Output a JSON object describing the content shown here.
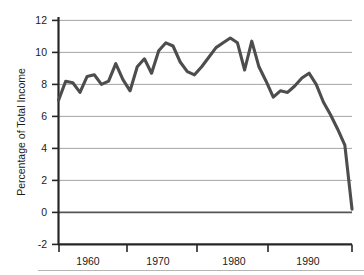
{
  "chart_data": {
    "type": "line",
    "title": "",
    "xlabel": "",
    "ylabel": "Percentage of Total Income",
    "xlim": [
      1955,
      1996
    ],
    "ylim": [
      -2,
      12
    ],
    "ytick_values": [
      12,
      10,
      8,
      6,
      4,
      2,
      0,
      -2
    ],
    "ytick_labels": [
      "12",
      "10",
      "8",
      "6",
      "4",
      "2",
      "0",
      "-2"
    ],
    "xtick_values": [
      1960,
      1970,
      1980,
      1990
    ],
    "xtick_labels": [
      "1960",
      "1970",
      "1980",
      "1990"
    ],
    "grid": "horizontal",
    "legend": "none",
    "line_color": "#4d4d4d",
    "axis_color": "#262626",
    "grid_color": "#9a9a9a",
    "x": [
      1955,
      1956,
      1957,
      1958,
      1959,
      1960,
      1961,
      1962,
      1963,
      1964,
      1965,
      1966,
      1967,
      1968,
      1969,
      1970,
      1971,
      1972,
      1973,
      1974,
      1975,
      1976,
      1977,
      1978,
      1979,
      1980,
      1981,
      1982,
      1983,
      1984,
      1985,
      1986,
      1987,
      1988,
      1989,
      1990,
      1991,
      1992,
      1993,
      1994,
      1995,
      1996
    ],
    "values": [
      7.0,
      8.2,
      8.1,
      7.5,
      8.5,
      8.6,
      8.0,
      8.2,
      9.3,
      8.3,
      7.6,
      9.1,
      9.6,
      8.7,
      10.1,
      10.6,
      10.4,
      9.4,
      8.8,
      8.6,
      9.1,
      9.7,
      10.3,
      10.6,
      10.9,
      10.6,
      8.9,
      10.7,
      9.1,
      8.2,
      7.2,
      7.6,
      7.5,
      7.9,
      8.4,
      8.7,
      8.0,
      6.9,
      6.1,
      5.2,
      4.2,
      0.2
    ],
    "series_name": "Percentage of Total Income"
  },
  "figure": {
    "background_color": "#ffffff",
    "footer_rule": true
  }
}
